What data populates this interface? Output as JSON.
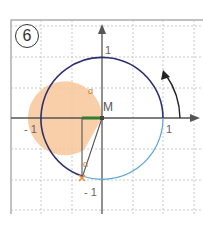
{
  "figure": {
    "number_badge": "6",
    "center_label": "M",
    "angle_label": "α",
    "angle_label_small": "α",
    "axis_labels": {
      "x_pos": "1",
      "x_neg": "- 1",
      "y_pos": "1",
      "y_neg": "- 1"
    },
    "colors": {
      "unit_circle_dark": "#2b2f6e",
      "unit_circle_light": "#5aa6d6",
      "angle_fill": "#f7c79a",
      "cos_segment": "#2e7d32",
      "point": "#f08a3c",
      "axis": "#555555",
      "grid": "#bbbbbb"
    }
  }
}
